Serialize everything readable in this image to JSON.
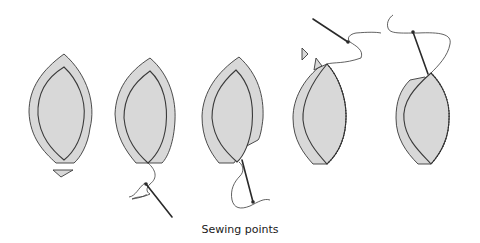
{
  "diagram": {
    "caption": "Sewing points",
    "steps": [
      {
        "id": 1,
        "description": "Petal shape with seam allowance and notch triangle below"
      },
      {
        "id": 2,
        "description": "Thread anchored at bottom point, needle below"
      },
      {
        "id": 3,
        "description": "Needle passing up through side seam"
      },
      {
        "id": 4,
        "description": "Side seam stitched, needle and thread at top, notch triangles at top"
      },
      {
        "id": 5,
        "description": "Completed stitched seam with needle at top"
      }
    ],
    "colors": {
      "fill": "#d8d8d8",
      "line": "#3a3a3a",
      "background": "#ffffff"
    }
  }
}
